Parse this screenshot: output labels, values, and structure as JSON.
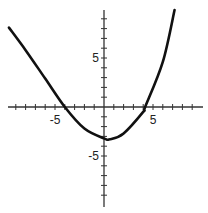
{
  "chart_data": {
    "type": "line",
    "title": "",
    "xlabel": "",
    "ylabel": "",
    "xlim": [
      -10,
      10
    ],
    "ylim": [
      -10,
      10
    ],
    "grid": false,
    "legend": null,
    "x_tick_labels": [
      {
        "value": -5,
        "label": "-5"
      },
      {
        "value": 5,
        "label": "5"
      }
    ],
    "y_tick_labels": [
      {
        "value": 5,
        "label": "5"
      },
      {
        "value": -5,
        "label": "-5"
      }
    ],
    "tick_step": 1,
    "series": [
      {
        "name": "parabola",
        "description": "upward-opening parabola, vertex near (0.5, -3.3), x-intercepts near -4 and 4.2",
        "x": [
          -9.7,
          -8,
          -6,
          -4,
          -2,
          0,
          0.6,
          2,
          4,
          4.2,
          6,
          7.2
        ],
        "y": [
          8.1,
          5.8,
          2.9,
          0.0,
          -2.2,
          -3.2,
          -3.3,
          -2.7,
          -0.5,
          0.0,
          4.6,
          9.9
        ]
      }
    ]
  }
}
